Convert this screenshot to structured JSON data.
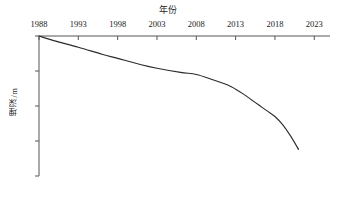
{
  "chart_data": {
    "type": "line",
    "title": "年份",
    "xlabel": "年份",
    "ylabel": "埋深/m",
    "xlim": [
      1988,
      2025
    ],
    "ylim": [
      0,
      20
    ],
    "y_inverted": true,
    "x_axis_position": "top",
    "grid": false,
    "legend": "none",
    "xticks": [
      1988,
      1993,
      1998,
      2003,
      2008,
      2013,
      2018,
      2023
    ],
    "xtick_labels": [
      "1988",
      "1993",
      "1998",
      "2003",
      "2008",
      "2013",
      "2018",
      "2023"
    ],
    "yticks": [
      0,
      5,
      10,
      15,
      20
    ],
    "ytick_labels": [
      "0",
      "5",
      "10",
      "15",
      "20"
    ],
    "series": [
      {
        "name": "埋深",
        "x": [
          1988,
          1990,
          1993,
          1996,
          1998,
          2001,
          2003,
          2006,
          2008,
          2010,
          2012,
          2013,
          2014,
          2015,
          2016,
          2017,
          2018,
          2019,
          2020,
          2021
        ],
        "values": [
          0.0,
          0.7,
          1.6,
          2.6,
          3.2,
          4.1,
          4.6,
          5.2,
          5.5,
          6.2,
          7.0,
          7.6,
          8.3,
          9.1,
          9.9,
          10.7,
          11.5,
          12.7,
          14.3,
          16.2
        ]
      }
    ]
  },
  "axis": {
    "title_text": "年份",
    "ylabel_text": "埋深/m",
    "line_color": "#555555",
    "series_color": "#2b2b2b"
  }
}
